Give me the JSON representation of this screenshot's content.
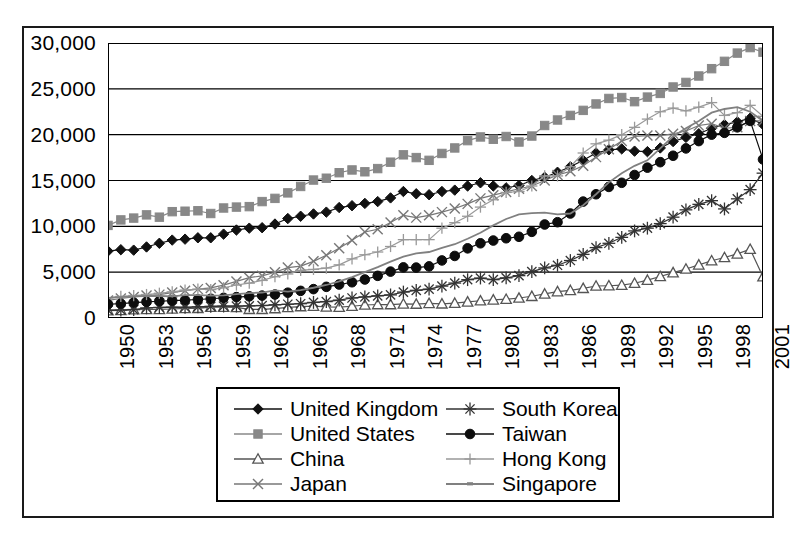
{
  "chart_data": {
    "type": "line",
    "title": "",
    "subtitle": "",
    "xlabel": "",
    "ylabel": "",
    "xlim": [
      1950,
      2001
    ],
    "ylim": [
      0,
      30000
    ],
    "y_ticks": [
      0,
      5000,
      10000,
      15000,
      20000,
      25000,
      30000
    ],
    "y_tick_labels": [
      "0",
      "5,000",
      "10,000",
      "15,000",
      "20,000",
      "25,000",
      "30,000"
    ],
    "x_tick_labels": [
      "1950",
      "1953",
      "1956",
      "1959",
      "1962",
      "1965",
      "1968",
      "1971",
      "1974",
      "1977",
      "1980",
      "1983",
      "1986",
      "1989",
      "1992",
      "1995",
      "1998",
      "2001"
    ],
    "x_tick_step": 3,
    "grid": "horizontal",
    "legend_position": "below",
    "x": [
      1950,
      1951,
      1952,
      1953,
      1954,
      1955,
      1956,
      1957,
      1958,
      1959,
      1960,
      1961,
      1962,
      1963,
      1964,
      1965,
      1966,
      1967,
      1968,
      1969,
      1970,
      1971,
      1972,
      1973,
      1974,
      1975,
      1976,
      1977,
      1978,
      1979,
      1980,
      1981,
      1982,
      1983,
      1984,
      1985,
      1986,
      1987,
      1988,
      1989,
      1990,
      1991,
      1992,
      1993,
      1994,
      1995,
      1996,
      1997,
      1998,
      1999,
      2000,
      2001
    ],
    "series": [
      {
        "name": "United Kingdom",
        "marker": "diamond",
        "color": "#111111",
        "values": [
          7300,
          7450,
          7400,
          7750,
          8150,
          8500,
          8600,
          8750,
          8750,
          9150,
          9600,
          9800,
          9850,
          10250,
          10850,
          11100,
          11350,
          11550,
          12050,
          12250,
          12500,
          12700,
          13100,
          13800,
          13550,
          13450,
          13800,
          13950,
          14400,
          14750,
          14400,
          14200,
          14450,
          15000,
          15350,
          15900,
          16500,
          17200,
          18000,
          18350,
          18450,
          18200,
          18150,
          18550,
          19250,
          19700,
          20100,
          20700,
          21100,
          21400,
          21800,
          21100
        ]
      },
      {
        "name": "United States",
        "marker": "square",
        "color": "#888888",
        "values": [
          10100,
          10700,
          10900,
          11250,
          11000,
          11600,
          11650,
          11700,
          11400,
          12000,
          12100,
          12150,
          12700,
          13050,
          13650,
          14350,
          15050,
          15250,
          15850,
          16150,
          15950,
          16300,
          17000,
          17800,
          17500,
          17200,
          17950,
          18550,
          19350,
          19750,
          19500,
          19800,
          19200,
          19850,
          21000,
          21600,
          22100,
          22650,
          23350,
          23950,
          24050,
          23600,
          24100,
          24500,
          25200,
          25700,
          26400,
          27200,
          28000,
          28900,
          29500,
          29000
        ]
      },
      {
        "name": "China",
        "marker": "triangle",
        "color": "#555555",
        "values": [
          800,
          830,
          900,
          930,
          940,
          980,
          1050,
          1060,
          1180,
          1190,
          1160,
          950,
          950,
          1030,
          1150,
          1250,
          1290,
          1210,
          1180,
          1280,
          1420,
          1470,
          1470,
          1530,
          1520,
          1600,
          1550,
          1620,
          1760,
          1880,
          1980,
          2050,
          2180,
          2370,
          2630,
          2880,
          3010,
          3240,
          3490,
          3520,
          3580,
          3790,
          4130,
          4530,
          4950,
          5350,
          5800,
          6250,
          6600,
          7000,
          7500,
          4500
        ]
      },
      {
        "name": "Japan",
        "marker": "cross",
        "color": "#777777",
        "values": [
          1920,
          2130,
          2300,
          2450,
          2550,
          2770,
          2970,
          3150,
          3280,
          3580,
          3990,
          4400,
          4600,
          4990,
          5500,
          5660,
          6180,
          6840,
          7620,
          8480,
          9380,
          9680,
          10420,
          11200,
          10950,
          11200,
          11550,
          11950,
          12450,
          13050,
          13400,
          13750,
          14100,
          14400,
          15000,
          15600,
          16000,
          16600,
          17550,
          18400,
          19300,
          19800,
          19900,
          19900,
          20100,
          20400,
          21000,
          21200,
          20700,
          20800,
          21500,
          21500
        ]
      },
      {
        "name": "South Korea",
        "marker": "star",
        "color": "#333333",
        "values": [
          850,
          870,
          920,
          1100,
          1150,
          1180,
          1170,
          1220,
          1270,
          1300,
          1300,
          1320,
          1360,
          1440,
          1500,
          1560,
          1700,
          1790,
          1950,
          2180,
          2300,
          2420,
          2520,
          2830,
          3020,
          3150,
          3480,
          3810,
          4180,
          4360,
          4180,
          4380,
          4620,
          5060,
          5460,
          5750,
          6270,
          6940,
          7680,
          8150,
          8800,
          9500,
          9800,
          10300,
          11000,
          11800,
          12400,
          12800,
          11900,
          13000,
          14000,
          15800
        ]
      },
      {
        "name": "Taiwan",
        "marker": "circle",
        "color": "#0d0d0d",
        "values": [
          1500,
          1560,
          1680,
          1760,
          1830,
          1900,
          1940,
          2020,
          2100,
          2200,
          2280,
          2360,
          2440,
          2560,
          2760,
          2960,
          3150,
          3400,
          3650,
          3900,
          4200,
          4600,
          5060,
          5520,
          5500,
          5630,
          6280,
          6770,
          7600,
          8150,
          8450,
          8700,
          8860,
          9400,
          10200,
          10450,
          11400,
          12700,
          13500,
          14300,
          14750,
          15600,
          16400,
          17000,
          17700,
          18500,
          19300,
          20000,
          20200,
          20800,
          21500,
          17300
        ]
      },
      {
        "name": "Hong Kong",
        "marker": "plus",
        "color": "#999999",
        "values": [
          2200,
          2350,
          2450,
          2560,
          2700,
          2850,
          3050,
          3150,
          3100,
          3300,
          3600,
          3800,
          4100,
          4500,
          4800,
          5200,
          5300,
          5450,
          5800,
          6450,
          6900,
          7200,
          7800,
          8550,
          8550,
          8550,
          9800,
          10400,
          11100,
          12100,
          12900,
          13700,
          13800,
          14400,
          15500,
          15500,
          16500,
          18000,
          19000,
          19400,
          20000,
          20800,
          21700,
          22500,
          22900,
          22600,
          23000,
          23500,
          22100,
          22400,
          23200,
          22000
        ]
      },
      {
        "name": "Singapore",
        "marker": "none",
        "color": "#808080",
        "values": [
          2200,
          2280,
          2350,
          2400,
          2400,
          2350,
          2500,
          2500,
          2450,
          2470,
          2600,
          2720,
          2780,
          3020,
          2880,
          3050,
          3300,
          3600,
          4000,
          4450,
          5000,
          5550,
          6150,
          6700,
          7050,
          7200,
          7650,
          8050,
          8650,
          9300,
          10100,
          10800,
          11300,
          11450,
          11500,
          11300,
          11400,
          12300,
          13500,
          14800,
          15800,
          16600,
          17200,
          18500,
          19800,
          20700,
          21500,
          22400,
          22800,
          23000,
          22500,
          21500
        ]
      }
    ]
  },
  "legend": {
    "items": [
      {
        "label": "United Kingdom",
        "marker": "diamond",
        "color": "#111111"
      },
      {
        "label": "South Korea",
        "marker": "star",
        "color": "#333333"
      },
      {
        "label": "United States",
        "marker": "square",
        "color": "#888888"
      },
      {
        "label": "Taiwan",
        "marker": "circle",
        "color": "#0d0d0d"
      },
      {
        "label": "China",
        "marker": "triangle",
        "color": "#555555"
      },
      {
        "label": "Hong Kong",
        "marker": "plus",
        "color": "#999999"
      },
      {
        "label": "Japan",
        "marker": "cross",
        "color": "#777777"
      },
      {
        "label": "Singapore",
        "marker": "none",
        "color": "#808080"
      }
    ]
  }
}
